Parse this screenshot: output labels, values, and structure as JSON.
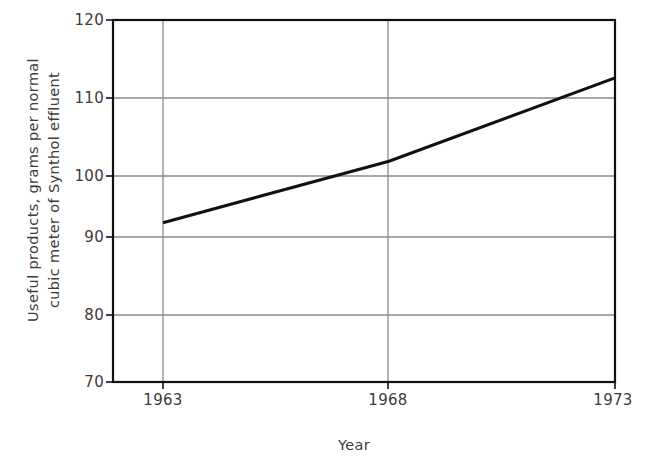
{
  "chart_data": {
    "type": "line",
    "title": "",
    "xlabel": "Year",
    "ylabel": "Useful products, grams per normal cubic meter of Synthol effluent",
    "ylabel_lines": [
      "Useful products, grams per normal",
      "cubic meter of Synthol effluent"
    ],
    "x": [
      1963,
      1968,
      1973
    ],
    "values": [
      92,
      100.5,
      112
    ],
    "xtick_labels": [
      "1963",
      "1968",
      "1973"
    ],
    "ytick_labels": [
      "120",
      "110",
      "100",
      "90",
      "80",
      "70"
    ],
    "ytick_values": [
      120,
      110,
      100,
      90,
      80,
      70
    ],
    "xlim": [
      1962,
      1973
    ],
    "ylim": [
      70,
      120
    ],
    "grid": true,
    "legend": null,
    "series": [
      {
        "name": "Useful products",
        "x": [
          1963,
          1968,
          1973
        ],
        "values": [
          92,
          100.5,
          112
        ]
      }
    ],
    "line_color": "#111111",
    "grid_color": "#8a8a8a",
    "axis_color": "#111111",
    "background_color": "#ffffff"
  }
}
